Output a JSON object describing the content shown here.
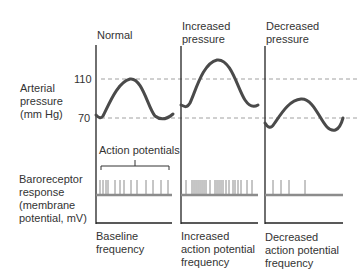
{
  "columns": [
    {
      "title_line1": "Normal",
      "title_line2": "",
      "footer_line1": "Baseline",
      "footer_line2": "frequency",
      "footer_line3": ""
    },
    {
      "title_line1": "Increased",
      "title_line2": "pressure",
      "footer_line1": "Increased",
      "footer_line2": "action potential",
      "footer_line3": "frequency"
    },
    {
      "title_line1": "Decreased",
      "title_line2": "pressure",
      "footer_line1": "Decreased",
      "footer_line2": "action potential",
      "footer_line3": "frequency"
    }
  ],
  "left_labels": {
    "pressure": [
      "Arterial",
      "pressure",
      "(mm Hg)"
    ],
    "baroreceptor": [
      "Baroreceptor",
      "response",
      "(membrane",
      "potential, mV)"
    ]
  },
  "ticks": {
    "high": "110",
    "low": "70"
  },
  "annotation": "Action potentials",
  "colors": {
    "curve": "#4a4a4a",
    "axis": "#222222",
    "dashed": "#9a9a9a",
    "spike": "#8c8c8c"
  }
}
